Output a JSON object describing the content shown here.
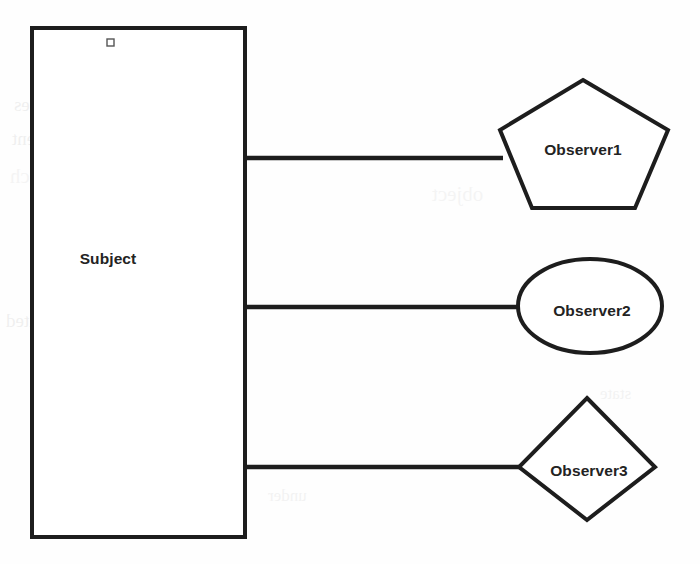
{
  "diagram": {
    "background_color": "#fefefe",
    "stroke_color": "#1d1d1d",
    "text_color": "#232323",
    "nodes": [
      {
        "id": "subject",
        "label": "Subject",
        "shape": "rectangle",
        "x": 32,
        "y": 28,
        "width": 213,
        "height": 509,
        "label_x": 108,
        "label_y": 260
      },
      {
        "id": "observer1",
        "label": "Observer1",
        "shape": "pentagon",
        "points": "583,80 668,130 635,208 532,208 500,130",
        "label_x": 583,
        "label_y": 151
      },
      {
        "id": "observer2",
        "label": "Observer2",
        "shape": "ellipse",
        "cx": 590,
        "cy": 306,
        "rx": 72,
        "ry": 47,
        "label_x": 592,
        "label_y": 312
      },
      {
        "id": "observer3",
        "label": "Observer3",
        "shape": "diamond",
        "points": "587,398 655,467 587,520 519,467",
        "label_x": 589,
        "label_y": 472
      }
    ],
    "connectors": [
      {
        "id": "subject-to-observer1",
        "x1": 245,
        "y1": 158,
        "x2": 503,
        "y2": 158
      },
      {
        "id": "subject-to-observer2",
        "x1": 245,
        "y1": 307,
        "x2": 521,
        "y2": 307
      },
      {
        "id": "subject-to-observer3",
        "x1": 245,
        "y1": 467,
        "x2": 522,
        "y2": 467
      }
    ],
    "markers": [
      {
        "id": "subject-top-handle",
        "x": 107,
        "y": 39,
        "size": 7
      }
    ]
  },
  "ghost_text": [
    {
      "text": "resources",
      "x": 14,
      "y": 94,
      "rot": 0,
      "variant": "a"
    },
    {
      "text": "of the",
      "x": 186,
      "y": 92,
      "rot": 0,
      "variant": "b"
    },
    {
      "text": "recent",
      "x": 12,
      "y": 128,
      "rot": 0,
      "variant": "a"
    },
    {
      "text": "which",
      "x": 10,
      "y": 164,
      "rot": 0,
      "variant": "c"
    },
    {
      "text": "for",
      "x": 152,
      "y": 162,
      "rot": 0,
      "variant": "b"
    },
    {
      "text": "located",
      "x": 6,
      "y": 310,
      "rot": 0,
      "variant": "a"
    },
    {
      "text": "some",
      "x": 150,
      "y": 308,
      "rot": 0,
      "variant": "b"
    },
    {
      "text": "under",
      "x": 268,
      "y": 486,
      "rot": 0,
      "variant": "b"
    },
    {
      "text": "object",
      "x": 432,
      "y": 182,
      "rot": 0,
      "variant": "c"
    },
    {
      "text": "state",
      "x": 600,
      "y": 384,
      "rot": 0,
      "variant": "b"
    }
  ]
}
